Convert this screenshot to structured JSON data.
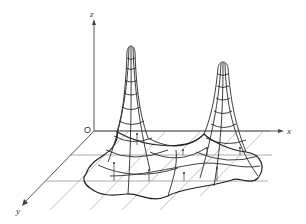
{
  "figure": {
    "axes": {
      "z_label": "z",
      "x_label": "x",
      "y_label": "y",
      "origin_label": "O"
    },
    "peaks": [
      {
        "name": "left-peak",
        "apex_x": 131,
        "apex_y": 46
      },
      {
        "name": "right-peak",
        "apex_x": 223,
        "apex_y": 62
      }
    ],
    "colors": {
      "line": "#2a2a2a",
      "grid": "#9a9a9a",
      "background": "#ffffff"
    }
  }
}
